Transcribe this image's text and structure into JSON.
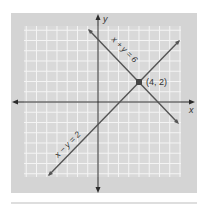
{
  "figure": {
    "axes": {
      "x_label": "x",
      "y_label": "y"
    },
    "point": {
      "label": "(4, 2)",
      "x": 4,
      "y": 2
    },
    "lines": [
      {
        "name": "line-x-plus-y-eq-6",
        "label": "x + y = 6",
        "equation": "x + y = 6"
      },
      {
        "name": "line-x-minus-y-eq-2",
        "label": "x − y = 2",
        "equation": "x − y = 2"
      }
    ],
    "colors": {
      "frame": "#d4d4d4",
      "grid_bg": "#d9d9d9",
      "grid_line": "#f4f4f4",
      "axis": "#2b2b2b",
      "line": "#555555",
      "point": "#444444",
      "rule": "#bdbdbd"
    }
  },
  "chart_data": {
    "type": "line",
    "title": "",
    "xlabel": "x",
    "ylabel": "y",
    "xlim": [
      -7,
      8
    ],
    "ylim": [
      -7.5,
      7.5
    ],
    "grid": true,
    "series": [
      {
        "name": "x + y = 6",
        "x": [
          -1,
          8
        ],
        "y": [
          7,
          -2
        ]
      },
      {
        "name": "x − y = 2",
        "x": [
          -5,
          8
        ],
        "y": [
          -7,
          6
        ]
      }
    ],
    "annotations": [
      {
        "text": "(4, 2)",
        "x": 4,
        "y": 2,
        "type": "intersection-point"
      }
    ]
  }
}
